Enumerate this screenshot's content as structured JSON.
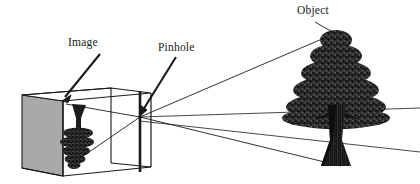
{
  "figure": {
    "background_color": "#ffffff",
    "line_color": "#1a1a1a",
    "panel_color": "#a8a8a8",
    "tree_color": "#2b2b2b"
  },
  "labels": {
    "image": "Image",
    "pinhole": "Pinhole",
    "object": "Object"
  },
  "parts": {
    "box": "pinhole-camera-box",
    "back_panel": "image-plane-panel",
    "front_panel": "pinhole-plane-panel",
    "projected_image": "inverted-tree-image",
    "object_tree": "upright-tree-object",
    "ray_top": "ray-from-treetop",
    "ray_bottom": "ray-from-treebase",
    "pinhole_point": "pinhole-aperture"
  },
  "geometry": {
    "pinhole_point": [
      140,
      117
    ],
    "tree_apex": [
      336,
      32
    ],
    "tree_base": [
      340,
      166
    ],
    "image_apex": [
      78,
      105
    ],
    "image_base": [
      73,
      160
    ]
  }
}
